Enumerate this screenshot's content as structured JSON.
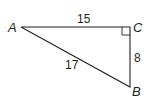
{
  "diagram": {
    "type": "right-triangle",
    "stroke_color": "#231f20",
    "vertices": [
      {
        "id": "A",
        "label": "A",
        "x": 21,
        "y": 27
      },
      {
        "id": "C",
        "label": "C",
        "x": 130,
        "y": 27
      },
      {
        "id": "B",
        "label": "B",
        "x": 130,
        "y": 87
      }
    ],
    "sides": [
      {
        "between": "AC",
        "label": "15"
      },
      {
        "between": "CB",
        "label": "8"
      },
      {
        "between": "AB",
        "label": "17"
      }
    ],
    "right_angle_at": "C"
  }
}
